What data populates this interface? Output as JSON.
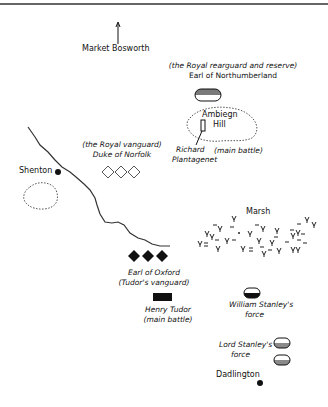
{
  "map": {
    "title": "Battle of Bosworth Field",
    "places": {
      "market_bosworth": "Market Bosworth",
      "shenton": "Shenton",
      "ambion_hill_line1": "Ambiegn",
      "ambion_hill_line2": "Hill",
      "marsh": "Marsh",
      "dadlington": "Dadlington"
    },
    "forces": {
      "northumberland": {
        "line1": "(the Royal rearguard and reserve)",
        "line2": "Earl of Northumberland"
      },
      "richard": {
        "line1": "Richard",
        "line2": "Plantagenet",
        "note": "(main battle)"
      },
      "norfolk": {
        "line1": "(the Royal vanguard)",
        "line2": "Duke of Norfolk"
      },
      "oxford": {
        "line1": "Earl of Oxford",
        "line2": "(Tudor's vanguard)"
      },
      "henry": {
        "line1": "Henry Tudor",
        "line2": "(main battle)"
      },
      "william_stanley": {
        "line1": "William Stanley's",
        "line2": "force"
      },
      "lord_stanley": {
        "line1": "Lord Stanley's",
        "line2": "force"
      }
    },
    "colors": {
      "ink": "#111111",
      "gray_fill": "#8a8a8a",
      "river": "#333333",
      "outline": "#444444"
    }
  }
}
